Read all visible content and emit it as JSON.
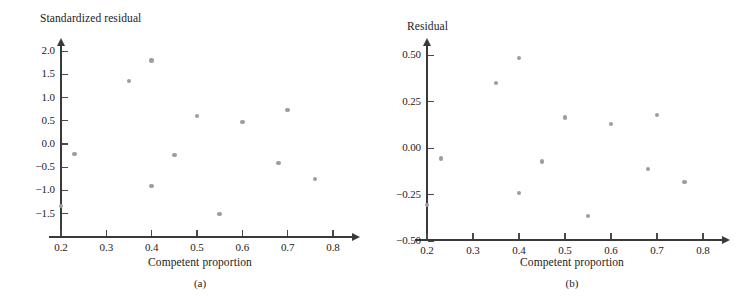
{
  "figure": {
    "marker_color": "#9d9d9d",
    "axis_color": "#3a3a3a"
  },
  "panels": [
    {
      "key": "a",
      "caption": "(a)",
      "ylabel": "Standardized residual",
      "xlabel": "Competent proportion",
      "yticks": [
        "2.0",
        "1.5",
        "1.0",
        "0.5",
        "0.0",
        "−0.5",
        "−1.0",
        "−1.5"
      ],
      "xticks": [
        "0.2",
        "0.3",
        "0.4",
        "0.5",
        "0.6",
        "0.7",
        "0.8"
      ]
    },
    {
      "key": "b",
      "caption": "(b)",
      "ylabel": "Residual",
      "xlabel": "Competent proportion",
      "yticks": [
        "0.50",
        "0.25",
        "0.00",
        "−0.25",
        "−0.50"
      ],
      "xticks": [
        "0.2",
        "0.3",
        "0.4",
        "0.5",
        "0.6",
        "0.7",
        "0.8"
      ]
    }
  ],
  "chart_data": [
    {
      "type": "scatter",
      "panel": "a",
      "title": "",
      "xlabel": "Competent proportion",
      "ylabel": "Standardized residual",
      "xlim": [
        0.155,
        0.835
      ],
      "ylim": [
        -1.65,
        2.2
      ],
      "xticks": [
        0.2,
        0.3,
        0.4,
        0.5,
        0.6,
        0.7,
        0.8
      ],
      "yticks": [
        2.0,
        1.5,
        1.0,
        0.5,
        0.0,
        -0.5,
        -1.0,
        -1.5
      ],
      "grid": false,
      "legend": null,
      "caption": "(a)",
      "x": [
        0.2,
        0.23,
        0.35,
        0.4,
        0.4,
        0.45,
        0.5,
        0.55,
        0.6,
        0.68,
        0.7,
        0.76
      ],
      "y": [
        -1.33,
        -0.22,
        1.36,
        1.8,
        -0.91,
        -0.24,
        0.6,
        -1.51,
        0.47,
        -0.41,
        0.73,
        -0.76
      ]
    },
    {
      "type": "scatter",
      "panel": "b",
      "title": "",
      "xlabel": "Competent proportion",
      "ylabel": "Residual",
      "xlim": [
        0.155,
        0.835
      ],
      "ylim": [
        -0.55,
        0.6
      ],
      "xticks": [
        0.2,
        0.3,
        0.4,
        0.5,
        0.6,
        0.7,
        0.8
      ],
      "yticks": [
        0.5,
        0.25,
        0.0,
        -0.25,
        -0.5
      ],
      "grid": false,
      "legend": null,
      "caption": "(b)",
      "x": [
        0.2,
        0.23,
        0.35,
        0.4,
        0.4,
        0.45,
        0.5,
        0.55,
        0.6,
        0.68,
        0.7,
        0.76
      ],
      "y": [
        -0.305,
        -0.055,
        0.35,
        0.485,
        -0.24,
        -0.07,
        0.165,
        -0.365,
        0.13,
        -0.11,
        0.18,
        -0.18
      ]
    }
  ]
}
